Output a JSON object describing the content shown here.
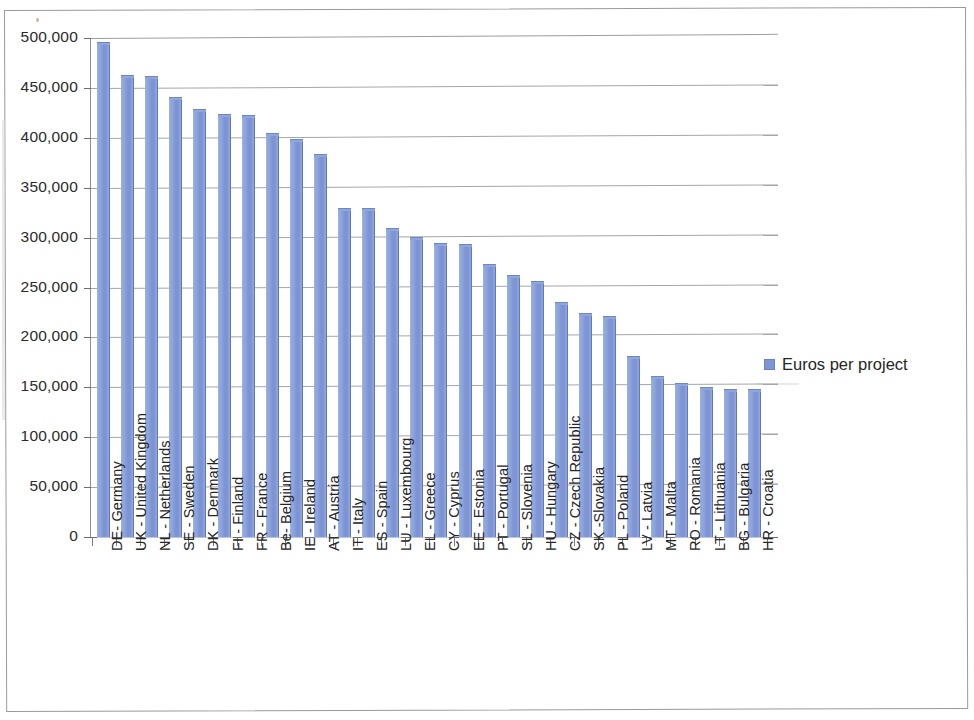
{
  "chart_data": {
    "type": "bar",
    "title": "",
    "subtitle": "",
    "xlabel": "",
    "ylabel": "",
    "ylim": [
      0,
      500000
    ],
    "ytick_step": 50000,
    "grid": true,
    "legend_position": "right",
    "series_name": "Euros per project",
    "bar_color": "#7e95d4",
    "ytick_labels": [
      "500,000",
      "450,000",
      "400,000",
      "350,000",
      "300,000",
      "250,000",
      "200,000",
      "150,000",
      "100,000",
      "50,000",
      "0"
    ],
    "categories": [
      "DE- Germany",
      "UK - United Kingdom",
      "NL - Netherlands",
      "SE - Sweden",
      "DK - Denmark",
      "FI - Finland",
      "FR - France",
      "Be- Belgium",
      "IE - Ireland",
      "AT - Austria",
      "IT - Italy",
      "ES - Spain",
      "LU - Luxembourg",
      "EL - Greece",
      "CY - Cyprus",
      "EE - Estonia",
      "PT - Portugal",
      "SL - Slovenia",
      "HU - Hungary",
      "CZ - Czech Republic",
      "SK -Slovakia",
      "PL - Poland",
      "LV - Latvia",
      "MT - Malta",
      "RO - Romania",
      "LT - Lithuania",
      "BG - Bulgaria",
      "HR - Croatia"
    ],
    "values": [
      494000,
      461000,
      460000,
      439000,
      427000,
      422000,
      421000,
      403000,
      397000,
      382000,
      328000,
      328000,
      308000,
      299000,
      293000,
      292000,
      272000,
      261000,
      255000,
      233000,
      222000,
      219000,
      179000,
      159000,
      152000,
      148000,
      146000,
      146000
    ]
  },
  "legend": {
    "entries": [
      {
        "label": "Euros per project",
        "color": "#7e95d4"
      }
    ]
  }
}
